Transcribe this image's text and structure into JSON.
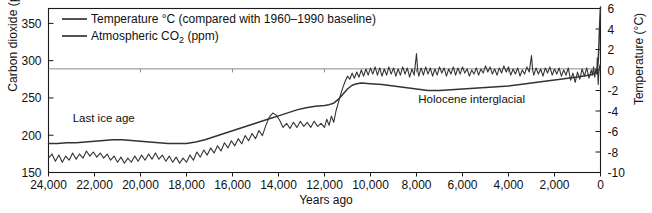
{
  "chart_data": {
    "type": "line",
    "title": "",
    "xlabel": "Years ago",
    "ylabel_left": "Carbon dioxide (ppm)",
    "ylabel_right": "Temperature (°C)",
    "xlim": [
      24000,
      0
    ],
    "x_inverted": true,
    "ylim_left": [
      150,
      370
    ],
    "ylim_right": [
      -10,
      6
    ],
    "xticks": [
      24000,
      22000,
      20000,
      18000,
      16000,
      14000,
      12000,
      10000,
      8000,
      6000,
      4000,
      2000,
      0
    ],
    "xticklabels": [
      "24,000",
      "22,000",
      "20,000",
      "18,000",
      "16,000",
      "14,000",
      "12,000",
      "10,000",
      "8,000",
      "6,000",
      "4,000",
      "2,000",
      "0"
    ],
    "yticks_left": [
      150,
      200,
      250,
      300,
      350
    ],
    "yticklabels_left": [
      "150",
      "200",
      "250",
      "300",
      "350"
    ],
    "yticks_right": [
      -10,
      -8,
      -6,
      -4,
      -2,
      0,
      2,
      4,
      6
    ],
    "yticklabels_right": [
      "-10",
      "-8",
      "-6",
      "-4",
      "-2",
      "0",
      "2",
      "4",
      "6"
    ],
    "grid": false,
    "reference_line": {
      "value_left": 289,
      "value_right": 0,
      "color": "#8c8c8c"
    },
    "legend_position": "top-left",
    "legend": [
      {
        "name": "Temperature °C (compared with 1960–1990 baseline)",
        "color": "#333333"
      },
      {
        "name": "Atmospheric CO2 (ppm)",
        "color": "#333333"
      }
    ],
    "annotations": [
      {
        "text": "Last ice age",
        "x": 21600,
        "y_left": 218
      },
      {
        "text": "Holocene interglacial",
        "x": 5600,
        "y_left": 243
      }
    ],
    "series": [
      {
        "name": "Atmospheric CO2 (ppm)",
        "axis": "left",
        "units": "ppm",
        "color": "#333333",
        "points": [
          [
            24000,
            189
          ],
          [
            23600,
            189
          ],
          [
            23200,
            190
          ],
          [
            22800,
            190
          ],
          [
            22400,
            191
          ],
          [
            22000,
            192
          ],
          [
            21600,
            193
          ],
          [
            21200,
            194
          ],
          [
            20800,
            194
          ],
          [
            20400,
            193
          ],
          [
            20000,
            192
          ],
          [
            19600,
            191
          ],
          [
            19200,
            190
          ],
          [
            18800,
            189
          ],
          [
            18400,
            189
          ],
          [
            18000,
            189
          ],
          [
            17600,
            191
          ],
          [
            17200,
            194
          ],
          [
            16800,
            198
          ],
          [
            16400,
            202
          ],
          [
            16000,
            206
          ],
          [
            15600,
            210
          ],
          [
            15200,
            214
          ],
          [
            14800,
            218
          ],
          [
            14400,
            222
          ],
          [
            14000,
            226
          ],
          [
            13600,
            230
          ],
          [
            13200,
            234
          ],
          [
            12800,
            237
          ],
          [
            12400,
            239
          ],
          [
            12000,
            240
          ],
          [
            11800,
            241
          ],
          [
            11600,
            243
          ],
          [
            11400,
            248
          ],
          [
            11200,
            255
          ],
          [
            11000,
            262
          ],
          [
            10800,
            267
          ],
          [
            10600,
            269
          ],
          [
            10400,
            270
          ],
          [
            10000,
            269
          ],
          [
            9500,
            268
          ],
          [
            9000,
            266
          ],
          [
            8500,
            264
          ],
          [
            8000,
            262
          ],
          [
            7500,
            260
          ],
          [
            7000,
            260
          ],
          [
            6500,
            261
          ],
          [
            6000,
            262
          ],
          [
            5500,
            263
          ],
          [
            5000,
            264
          ],
          [
            4500,
            265
          ],
          [
            4000,
            266
          ],
          [
            3500,
            268
          ],
          [
            3000,
            270
          ],
          [
            2500,
            272
          ],
          [
            2000,
            274
          ],
          [
            1500,
            276
          ],
          [
            1000,
            278
          ],
          [
            600,
            280
          ],
          [
            400,
            281
          ],
          [
            300,
            282
          ],
          [
            250,
            283
          ],
          [
            200,
            285
          ],
          [
            150,
            288
          ],
          [
            120,
            293
          ],
          [
            100,
            300
          ],
          [
            80,
            312
          ],
          [
            60,
            328
          ],
          [
            40,
            345
          ],
          [
            20,
            360
          ],
          [
            0,
            372
          ]
        ]
      },
      {
        "name": "Temperature °C (compared with 1960–1990 baseline)",
        "axis": "right",
        "units": "°C",
        "color": "#333333",
        "points": [
          [
            24000,
            -8.6
          ],
          [
            23850,
            -8.2
          ],
          [
            23700,
            -8.9
          ],
          [
            23550,
            -8.3
          ],
          [
            23400,
            -9.0
          ],
          [
            23250,
            -8.4
          ],
          [
            23100,
            -8.8
          ],
          [
            22950,
            -8.1
          ],
          [
            22800,
            -8.7
          ],
          [
            22650,
            -8.2
          ],
          [
            22500,
            -8.6
          ],
          [
            22350,
            -7.9
          ],
          [
            22200,
            -8.4
          ],
          [
            22050,
            -8.0
          ],
          [
            21900,
            -8.5
          ],
          [
            21750,
            -8.1
          ],
          [
            21600,
            -8.6
          ],
          [
            21450,
            -8.2
          ],
          [
            21300,
            -8.8
          ],
          [
            21150,
            -8.4
          ],
          [
            21000,
            -9.0
          ],
          [
            20850,
            -8.5
          ],
          [
            20700,
            -9.1
          ],
          [
            20550,
            -8.6
          ],
          [
            20400,
            -9.0
          ],
          [
            20250,
            -8.4
          ],
          [
            20100,
            -8.9
          ],
          [
            19950,
            -8.3
          ],
          [
            19800,
            -8.8
          ],
          [
            19650,
            -8.2
          ],
          [
            19500,
            -8.7
          ],
          [
            19350,
            -8.1
          ],
          [
            19200,
            -8.7
          ],
          [
            19050,
            -8.3
          ],
          [
            18900,
            -8.9
          ],
          [
            18750,
            -8.4
          ],
          [
            18600,
            -9.0
          ],
          [
            18450,
            -8.5
          ],
          [
            18300,
            -9.1
          ],
          [
            18150,
            -8.6
          ],
          [
            18000,
            -9.0
          ],
          [
            17850,
            -8.3
          ],
          [
            17700,
            -8.8
          ],
          [
            17550,
            -8.0
          ],
          [
            17400,
            -8.5
          ],
          [
            17250,
            -7.8
          ],
          [
            17100,
            -8.3
          ],
          [
            16950,
            -7.6
          ],
          [
            16800,
            -8.1
          ],
          [
            16650,
            -7.4
          ],
          [
            16500,
            -7.9
          ],
          [
            16350,
            -7.1
          ],
          [
            16200,
            -7.6
          ],
          [
            16050,
            -6.9
          ],
          [
            15900,
            -7.4
          ],
          [
            15750,
            -6.7
          ],
          [
            15600,
            -7.2
          ],
          [
            15450,
            -6.4
          ],
          [
            15300,
            -6.9
          ],
          [
            15150,
            -6.2
          ],
          [
            15000,
            -6.7
          ],
          [
            14850,
            -5.9
          ],
          [
            14700,
            -6.4
          ],
          [
            14550,
            -5.4
          ],
          [
            14400,
            -4.6
          ],
          [
            14250,
            -4.2
          ],
          [
            14100,
            -4.4
          ],
          [
            13950,
            -4.9
          ],
          [
            13800,
            -5.6
          ],
          [
            13650,
            -5.2
          ],
          [
            13500,
            -5.7
          ],
          [
            13350,
            -5.1
          ],
          [
            13200,
            -5.6
          ],
          [
            13050,
            -5.0
          ],
          [
            12900,
            -5.5
          ],
          [
            12750,
            -5.1
          ],
          [
            12600,
            -5.6
          ],
          [
            12450,
            -5.0
          ],
          [
            12300,
            -5.5
          ],
          [
            12150,
            -5.2
          ],
          [
            12000,
            -5.6
          ],
          [
            11900,
            -4.8
          ],
          [
            11800,
            -5.4
          ],
          [
            11700,
            -4.5
          ],
          [
            11600,
            -5.1
          ],
          [
            11500,
            -4.0
          ],
          [
            11400,
            -3.2
          ],
          [
            11300,
            -2.4
          ],
          [
            11200,
            -1.7
          ],
          [
            11100,
            -1.1
          ],
          [
            11000,
            -0.6
          ],
          [
            10900,
            -0.9
          ],
          [
            10800,
            -0.3
          ],
          [
            10700,
            -0.8
          ],
          [
            10600,
            -0.2
          ],
          [
            10500,
            -0.7
          ],
          [
            10400,
            0.0
          ],
          [
            10300,
            -0.6
          ],
          [
            10200,
            0.1
          ],
          [
            10100,
            -0.5
          ],
          [
            10000,
            0.2
          ],
          [
            9900,
            -0.4
          ],
          [
            9800,
            0.3
          ],
          [
            9700,
            -0.5
          ],
          [
            9600,
            0.2
          ],
          [
            9500,
            -0.6
          ],
          [
            9400,
            0.1
          ],
          [
            9300,
            -0.5
          ],
          [
            9200,
            0.3
          ],
          [
            9100,
            -0.4
          ],
          [
            9000,
            0.2
          ],
          [
            8900,
            -0.6
          ],
          [
            8800,
            0.1
          ],
          [
            8700,
            -0.5
          ],
          [
            8600,
            0.3
          ],
          [
            8500,
            -0.4
          ],
          [
            8400,
            0.2
          ],
          [
            8300,
            -0.7
          ],
          [
            8200,
            0.1
          ],
          [
            8100,
            -0.5
          ],
          [
            8000,
            1.6
          ],
          [
            7950,
            0.0
          ],
          [
            7900,
            -0.6
          ],
          [
            7800,
            0.2
          ],
          [
            7700,
            -0.5
          ],
          [
            7600,
            0.3
          ],
          [
            7500,
            -0.4
          ],
          [
            7400,
            0.2
          ],
          [
            7300,
            -0.6
          ],
          [
            7200,
            0.1
          ],
          [
            7100,
            -0.5
          ],
          [
            7000,
            0.3
          ],
          [
            6900,
            -0.3
          ],
          [
            6800,
            0.2
          ],
          [
            6700,
            -0.6
          ],
          [
            6600,
            0.1
          ],
          [
            6500,
            -0.4
          ],
          [
            6400,
            0.3
          ],
          [
            6300,
            -0.5
          ],
          [
            6200,
            0.2
          ],
          [
            6100,
            -0.4
          ],
          [
            6000,
            0.3
          ],
          [
            5900,
            -0.3
          ],
          [
            5800,
            0.1
          ],
          [
            5700,
            -0.6
          ],
          [
            5600,
            0.0
          ],
          [
            5500,
            -0.4
          ],
          [
            5400,
            0.2
          ],
          [
            5300,
            -0.5
          ],
          [
            5200,
            0.1
          ],
          [
            5100,
            -0.3
          ],
          [
            5000,
            0.4
          ],
          [
            4900,
            -0.2
          ],
          [
            4800,
            0.3
          ],
          [
            4700,
            -0.4
          ],
          [
            4600,
            0.1
          ],
          [
            4500,
            -0.5
          ],
          [
            4400,
            0.2
          ],
          [
            4300,
            -0.3
          ],
          [
            4200,
            0.4
          ],
          [
            4100,
            -0.2
          ],
          [
            4000,
            0.3
          ],
          [
            3900,
            -0.5
          ],
          [
            3800,
            0.1
          ],
          [
            3700,
            -0.4
          ],
          [
            3600,
            0.2
          ],
          [
            3500,
            -0.6
          ],
          [
            3400,
            0.0
          ],
          [
            3300,
            -0.4
          ],
          [
            3200,
            0.3
          ],
          [
            3100,
            -0.2
          ],
          [
            3000,
            1.4
          ],
          [
            2950,
            0.0
          ],
          [
            2900,
            -0.5
          ],
          [
            2800,
            0.2
          ],
          [
            2700,
            -0.4
          ],
          [
            2600,
            0.1
          ],
          [
            2500,
            -0.6
          ],
          [
            2400,
            0.2
          ],
          [
            2300,
            -0.3
          ],
          [
            2200,
            0.3
          ],
          [
            2100,
            -0.5
          ],
          [
            2000,
            0.1
          ],
          [
            1900,
            -0.4
          ],
          [
            1800,
            0.2
          ],
          [
            1700,
            -0.6
          ],
          [
            1600,
            0.0
          ],
          [
            1500,
            -0.5
          ],
          [
            1400,
            0.2
          ],
          [
            1300,
            -1.0
          ],
          [
            1200,
            -0.3
          ],
          [
            1100,
            -1.2
          ],
          [
            1000,
            -0.2
          ],
          [
            900,
            -0.9
          ],
          [
            800,
            0.1
          ],
          [
            700,
            -0.6
          ],
          [
            600,
            0.2
          ],
          [
            500,
            -0.8
          ],
          [
            400,
            0.0
          ],
          [
            350,
            -0.5
          ],
          [
            300,
            0.3
          ],
          [
            250,
            -0.7
          ],
          [
            200,
            0.1
          ],
          [
            160,
            -0.4
          ],
          [
            140,
            1.2
          ],
          [
            120,
            -0.2
          ],
          [
            100,
            -1.4
          ],
          [
            80,
            -0.5
          ],
          [
            60,
            0.0
          ],
          [
            40,
            0.3
          ],
          [
            20,
            0.5
          ],
          [
            0,
            0.6
          ]
        ]
      }
    ]
  }
}
